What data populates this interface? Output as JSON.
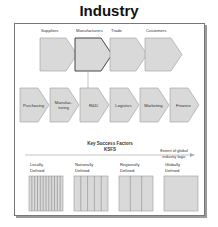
{
  "title": "Industry",
  "industry_chain": [
    {
      "label": "Suppliers",
      "highlighted": false
    },
    {
      "label": "Manufacturers",
      "highlighted": true
    },
    {
      "label": "Trade",
      "highlighted": false
    },
    {
      "label": "Customers",
      "highlighted": false
    }
  ],
  "value_chain": [
    {
      "line1": "Purchasing",
      "line2": ""
    },
    {
      "line1": "Manufac-",
      "line2": "turing"
    },
    {
      "line1": "R&D",
      "line2": ""
    },
    {
      "line1": "Logistics",
      "line2": ""
    },
    {
      "line1": "Marketing",
      "line2": ""
    },
    {
      "line1": "Finance",
      "line2": ""
    }
  ],
  "ksf": {
    "title_line1": "Key Success Factors",
    "title_line2": "KSFS",
    "axis_label_line1": "Extent of global",
    "axis_label_line2": "industry logic"
  },
  "scope_boxes": [
    {
      "line1": "Locally",
      "line2": "Defined",
      "stripes": 12
    },
    {
      "line1": "Nationally",
      "line2": "Defined",
      "stripes": 5
    },
    {
      "line1": "Regionally",
      "line2": "Defined",
      "stripes": 3
    },
    {
      "line1": "Globally",
      "line2": "Defined",
      "stripes": 1
    }
  ],
  "colors": {
    "shape_fill": "#d9d9d9",
    "shape_stroke": "#9a9a9a",
    "highlight_stroke": "#333333",
    "arrow": "#aaaaaa"
  }
}
